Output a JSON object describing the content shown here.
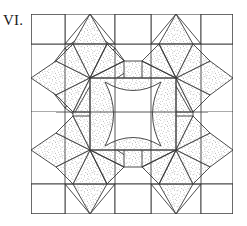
{
  "figure": {
    "label": "VI.",
    "kind": "quilt-block-line-diagram"
  },
  "canvas": {
    "width": 247,
    "height": 226
  },
  "block": {
    "x": 31,
    "y": 14,
    "width": 202,
    "height": 200,
    "grid_columns": 6,
    "grid_rows": 6,
    "cell_size": 33.6
  },
  "colors": {
    "background": "#ffffff",
    "outline": "#3a3a3a",
    "stipple_dot": "#6e6e6e",
    "patch_fill": "#ffffff",
    "label_text": "#1a1a1a"
  },
  "style": {
    "outline_width": 0.9,
    "stipple_density": 2600,
    "stipple_dot_radius": 0.42
  },
  "stars": [
    {
      "name": "star-top-left",
      "cx": 90,
      "cy": 78,
      "outer_radius": 47.5,
      "points": 8
    },
    {
      "name": "star-top-right",
      "cx": 176,
      "cy": 78,
      "outer_radius": 47.5,
      "points": 8
    },
    {
      "name": "star-bottom-left",
      "cx": 90,
      "cy": 150,
      "outer_radius": 47.5,
      "points": 8
    },
    {
      "name": "star-bottom-right",
      "cx": 176,
      "cy": 150,
      "outer_radius": 47.5,
      "points": 8
    }
  ],
  "center_medallion": {
    "name": "concave-square-center",
    "left": 105,
    "top": 82,
    "right": 161,
    "bottom": 146,
    "arc_bulge": 17,
    "fill": "#ffffff"
  },
  "legend": {
    "shaded_meaning": "stippled (printed) fabric",
    "plain_meaning": "plain (background) fabric"
  }
}
